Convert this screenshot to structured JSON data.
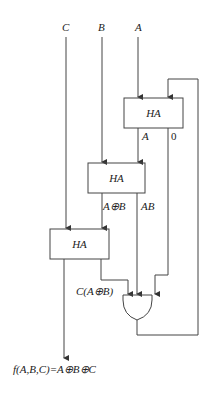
{
  "inputs": {
    "c": "C",
    "b": "B",
    "a": "A"
  },
  "blocks": {
    "ha_top": "HA",
    "ha_mid": "HA",
    "ha_bot": "HA"
  },
  "signals": {
    "top_sum": "A",
    "top_carry": "0",
    "mid_sum": "A⊕B",
    "mid_carry": "AB",
    "bot_carry": "C(A⊕B)"
  },
  "gate": {
    "type": "OR"
  },
  "output": {
    "label": "f(A,B,C)=A⊕B⊕C"
  },
  "colors": {
    "line": "#444444",
    "text": "#222222"
  }
}
